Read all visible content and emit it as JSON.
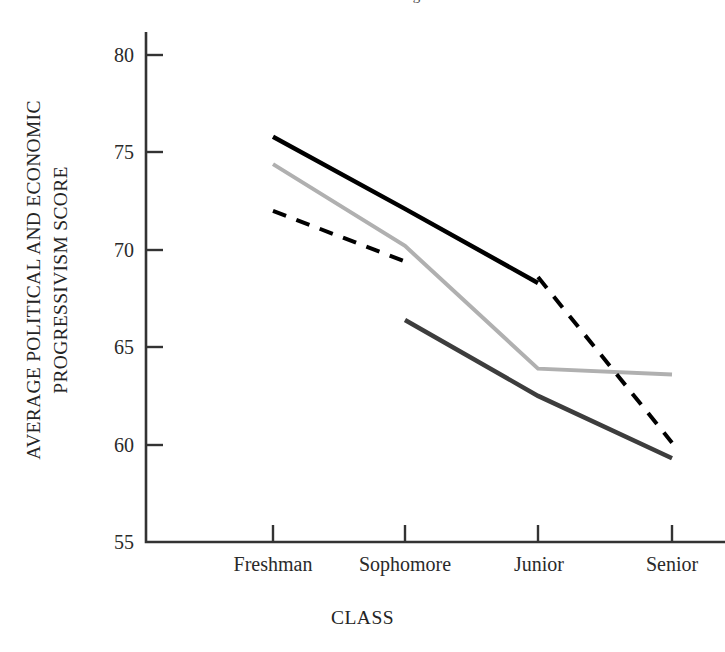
{
  "figure": {
    "cropped_header_text": "Political and Economic Progressivism",
    "background_color": "#ffffff"
  },
  "axes": {
    "y_title_line1": "AVERAGE POLITICAL AND ECONOMIC",
    "y_title_line2": "PROGRESSIVISM SCORE",
    "x_title": "CLASS",
    "y_ticks": [
      "80",
      "75",
      "70",
      "65",
      "60",
      "55"
    ],
    "x_ticks": [
      "Freshman",
      "Sophomore",
      "Junior",
      "Senior"
    ]
  },
  "colors": {
    "axis": "#333333",
    "series_black_solid": "#000000",
    "series_light_gray": "#b0b0b0",
    "series_dark_gray": "#3d3d3d",
    "series_black_dashed": "#000000"
  },
  "chart_data": {
    "type": "line",
    "title": "",
    "subtitle": "",
    "xlabel": "CLASS",
    "ylabel": "AVERAGE POLITICAL AND ECONOMIC PROGRESSIVISM SCORE",
    "categories": [
      "Freshman",
      "Sophomore",
      "Junior",
      "Senior"
    ],
    "ylim": [
      55,
      80
    ],
    "yticks": [
      55,
      60,
      65,
      70,
      75,
      80
    ],
    "grid": false,
    "legend": "none",
    "series": [
      {
        "name": "black-solid",
        "style": "solid",
        "color": "#000000",
        "width": 4.5,
        "points": [
          {
            "x": "Freshman",
            "y": 75.8
          },
          {
            "x": "Sophomore",
            "y": 72.1
          },
          {
            "x": "Junior",
            "y": 68.3
          }
        ],
        "values": [
          75.8,
          72.1,
          68.3,
          null
        ]
      },
      {
        "name": "light-gray-solid",
        "style": "solid",
        "color": "#b0b0b0",
        "width": 4.0,
        "points": [
          {
            "x": "Freshman",
            "y": 74.4
          },
          {
            "x": "Sophomore",
            "y": 70.2
          },
          {
            "x": "Junior",
            "y": 63.9
          },
          {
            "x": "Senior",
            "y": 63.6
          }
        ],
        "values": [
          74.4,
          70.2,
          63.9,
          63.6
        ]
      },
      {
        "name": "black-dashed",
        "style": "dashed",
        "color": "#000000",
        "width": 4.0,
        "points": [
          {
            "x": "Freshman",
            "y": 72.0
          },
          {
            "x": "Sophomore",
            "y": 69.4
          },
          {
            "x": "Junior",
            "y": 68.6
          },
          {
            "x": "Senior",
            "y": 60.1
          }
        ],
        "values": [
          72.0,
          69.4,
          68.6,
          60.1
        ],
        "gap_between": [
          "Sophomore",
          "Junior"
        ]
      },
      {
        "name": "dark-gray-solid",
        "style": "solid",
        "color": "#3d3d3d",
        "width": 4.5,
        "points": [
          {
            "x": "Sophomore",
            "y": 66.4
          },
          {
            "x": "Junior",
            "y": 62.5
          },
          {
            "x": "Senior",
            "y": 59.3
          }
        ],
        "values": [
          null,
          66.4,
          62.5,
          59.3
        ]
      }
    ]
  }
}
